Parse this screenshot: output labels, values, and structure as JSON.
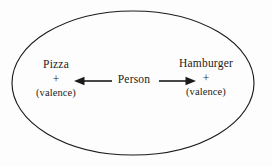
{
  "figure": {
    "type": "conflict-diagram",
    "background_color": "#fdfdfd",
    "ink_color": "#1b1b1b"
  },
  "boundary": {
    "shape": "ellipse",
    "name": "life-space-ellipse",
    "stroke_color": "#1b1b1b",
    "stroke_width": 1.1,
    "center_x": 133,
    "center_y": 83,
    "radius_x": 121,
    "radius_y": 72
  },
  "nodes": {
    "left": {
      "term": "Pizza",
      "sign": "+",
      "valence": "(valence)"
    },
    "center": {
      "term": "Person"
    },
    "right": {
      "term": "Hamburger",
      "sign": "+",
      "valence": "(valence)"
    }
  },
  "arrows": [
    {
      "name": "arrow-person-to-pizza",
      "direction": "left",
      "from_x": 112,
      "to_x": 74,
      "y": 81
    },
    {
      "name": "arrow-person-to-hamburger",
      "direction": "right",
      "from_x": 159,
      "to_x": 196,
      "y": 81
    }
  ]
}
